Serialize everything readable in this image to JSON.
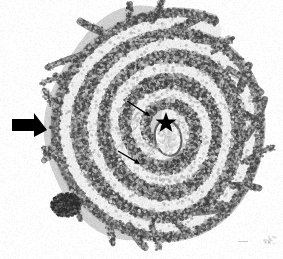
{
  "figure": {
    "kind": "histology-micrograph",
    "width": 283,
    "height": 259,
    "background_color": "#ffffff",
    "staining": "grayscale",
    "orientation": "spiral-swiss-roll"
  },
  "tissue": {
    "outline": {
      "center_x": 152,
      "center_y": 126,
      "radius_x": 108,
      "radius_y": 116,
      "rotation_deg": -6,
      "edge_color": "#8d8d8d",
      "fill_light": "#d2d2d2"
    },
    "spiral": {
      "turns": 4,
      "center_x": 166,
      "center_y": 130,
      "band_dark_color": "#7a7a7a",
      "band_light_color": "#e2e2e2",
      "mucosa_color": "#6e6e6e",
      "lumen_color": "#f2f2f2",
      "rings": [
        {
          "name": "outer-mucosa-ring",
          "rx": 100,
          "ry": 108,
          "tone": "#8a8a8a"
        },
        {
          "name": "outer-lumen-ring",
          "rx": 86,
          "ry": 93,
          "tone": "#e6e6e6"
        },
        {
          "name": "second-mucosa-ring",
          "rx": 74,
          "ry": 80,
          "tone": "#7d7d7d"
        },
        {
          "name": "second-lumen-ring",
          "rx": 60,
          "ry": 65,
          "tone": "#e4e4e4"
        },
        {
          "name": "third-mucosa-ring",
          "rx": 48,
          "ry": 52,
          "tone": "#767676"
        },
        {
          "name": "third-lumen-ring",
          "rx": 36,
          "ry": 39,
          "tone": "#e0e0e0"
        },
        {
          "name": "inner-mucosa-ring",
          "rx": 25,
          "ry": 28,
          "tone": "#707070"
        },
        {
          "name": "central-lumen",
          "rx": 13,
          "ry": 17,
          "tone": "#f6f6f6"
        }
      ]
    },
    "villi": {
      "label": "villi-projections",
      "count": 26,
      "color": "#6b6b6b",
      "region": "outer-circumference"
    },
    "lymphoid_follicle": {
      "label": "dark-lymphoid-aggregate",
      "center_x": 66,
      "center_y": 205,
      "radius_x": 12,
      "radius_y": 9,
      "color": "#3d3d3d"
    }
  },
  "annotations": {
    "block_arrow": {
      "label": "block-arrow-marker",
      "meaning": "thick solid arrow indicating outer mucosal region",
      "color": "#000000",
      "direction": "right",
      "tail_x": 12,
      "tail_y": 125,
      "tip_x": 47,
      "tip_y": 130,
      "shaft_height": 12,
      "head_half_height": 12
    },
    "star": {
      "label": "star-marker",
      "meaning": "asterisk marking central luminal structure",
      "color": "#000000",
      "center_x": 166,
      "center_y": 123,
      "outer_radius": 11,
      "inner_radius": 4.4,
      "points": 5,
      "glyph": "★"
    },
    "thin_arrows": [
      {
        "label": "thin-arrow-upper",
        "meaning": "fine arrow pointing to inner mucosal detail",
        "color": "#000000",
        "x1": 127,
        "y1": 101,
        "x2": 150,
        "y2": 116,
        "stroke_width": 1.4,
        "head_size": 6
      },
      {
        "label": "thin-arrow-lower",
        "meaning": "fine arrow pointing to lower inner mucosal detail",
        "color": "#000000",
        "x1": 118,
        "y1": 151,
        "x2": 140,
        "y2": 164,
        "stroke_width": 1.4,
        "head_size": 6
      }
    ],
    "scale_mark": {
      "label": "faint-scale-mark",
      "x": 238,
      "y": 241,
      "width": 10,
      "height": 1,
      "color": "#c9c9c9"
    },
    "corner_smudge": {
      "label": "faint-corner-smudge",
      "x": 263,
      "y": 236,
      "width": 12,
      "height": 7,
      "color": "#bdbdbd"
    }
  }
}
